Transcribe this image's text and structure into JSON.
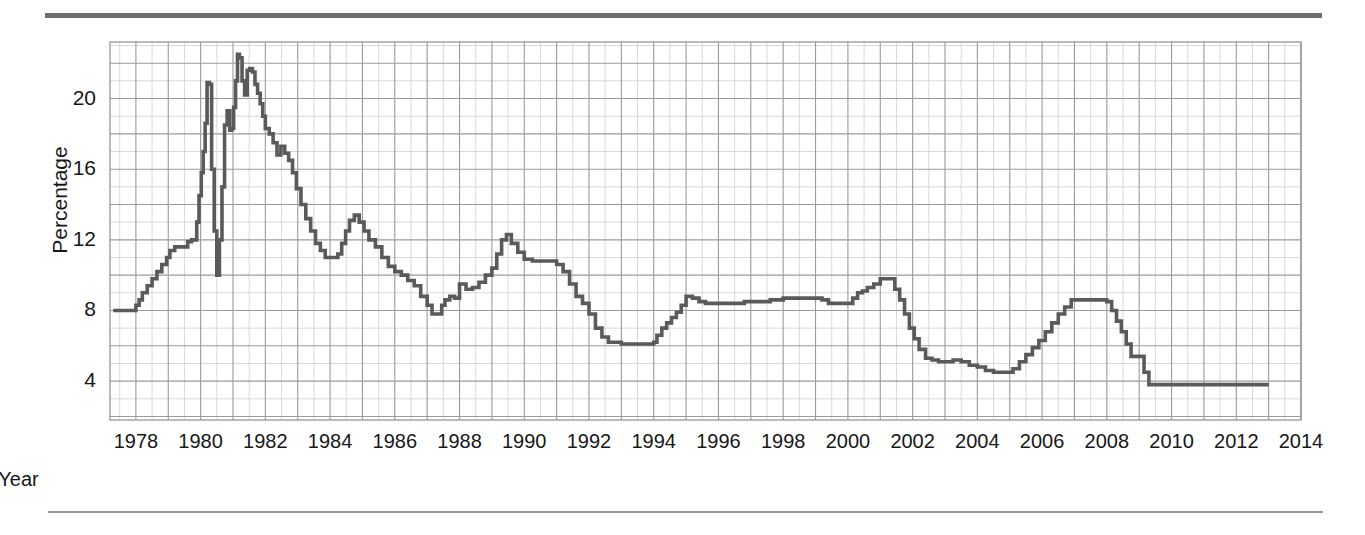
{
  "figure": {
    "has_top_rule": true,
    "has_bottom_rule": true,
    "background": "#ffffff",
    "line_color": "#5a5a5c",
    "grid_major_color": "#9b9b9e",
    "grid_minor_color": "#cfcfd2"
  },
  "chart_data": {
    "type": "line",
    "title": "",
    "subtitle": "",
    "xlabel": "Year",
    "ylabel": "Percentage",
    "xlim": [
      1977.2,
      2014.0
    ],
    "ylim": [
      1.8,
      23.2
    ],
    "xticks": [
      1978,
      1980,
      1982,
      1984,
      1986,
      1988,
      1990,
      1992,
      1994,
      1996,
      1998,
      2000,
      2002,
      2004,
      2006,
      2008,
      2010,
      2012,
      2014
    ],
    "xtick_labels": [
      "1978",
      "1980",
      "1982",
      "1984",
      "1986",
      "1988",
      "1990",
      "1992",
      "1994",
      "1996",
      "1998",
      "2000",
      "2002",
      "2004",
      "2006",
      "2008",
      "2010",
      "2012",
      "2014"
    ],
    "yticks": [
      4,
      8,
      12,
      16,
      20
    ],
    "ytick_labels": [
      "4",
      "8",
      "12",
      "16",
      "20"
    ],
    "grid": true,
    "grid_minor": true,
    "legend": false,
    "legend_position": "none",
    "series": [
      {
        "name": "Percentage",
        "color": "#5a5a5c",
        "x": [
          1977.3,
          1977.6,
          1977.9,
          1978.0,
          1978.1,
          1978.2,
          1978.35,
          1978.5,
          1978.65,
          1978.8,
          1978.95,
          1979.05,
          1979.2,
          1979.35,
          1979.5,
          1979.6,
          1979.72,
          1979.8,
          1979.88,
          1979.95,
          1980.02,
          1980.08,
          1980.14,
          1980.2,
          1980.27,
          1980.34,
          1980.42,
          1980.5,
          1980.58,
          1980.66,
          1980.74,
          1980.82,
          1980.9,
          1980.96,
          1981.02,
          1981.08,
          1981.14,
          1981.2,
          1981.28,
          1981.36,
          1981.44,
          1981.52,
          1981.6,
          1981.68,
          1981.76,
          1981.84,
          1981.92,
          1982.0,
          1982.12,
          1982.24,
          1982.36,
          1982.48,
          1982.6,
          1982.72,
          1982.84,
          1982.96,
          1983.1,
          1983.25,
          1983.4,
          1983.55,
          1983.7,
          1983.85,
          1984.0,
          1984.12,
          1984.24,
          1984.36,
          1984.48,
          1984.6,
          1984.75,
          1984.9,
          1985.05,
          1985.2,
          1985.4,
          1985.6,
          1985.8,
          1986.0,
          1986.2,
          1986.4,
          1986.6,
          1986.8,
          1987.0,
          1987.15,
          1987.3,
          1987.45,
          1987.55,
          1987.7,
          1987.85,
          1988.0,
          1988.2,
          1988.4,
          1988.6,
          1988.8,
          1989.0,
          1989.15,
          1989.3,
          1989.45,
          1989.6,
          1989.8,
          1990.0,
          1990.25,
          1990.5,
          1990.75,
          1991.0,
          1991.2,
          1991.4,
          1991.6,
          1991.8,
          1992.0,
          1992.2,
          1992.4,
          1992.6,
          1992.8,
          1993.0,
          1993.4,
          1993.8,
          1994.0,
          1994.1,
          1994.25,
          1994.4,
          1994.55,
          1994.7,
          1994.85,
          1995.0,
          1995.2,
          1995.4,
          1995.6,
          1995.8,
          1996.0,
          1996.4,
          1996.8,
          1997.2,
          1997.6,
          1998.0,
          1998.4,
          1998.8,
          1999.0,
          1999.2,
          1999.4,
          1999.6,
          1999.8,
          2000.0,
          2000.15,
          2000.3,
          2000.45,
          2000.6,
          2000.8,
          2001.0,
          2001.15,
          2001.3,
          2001.45,
          2001.6,
          2001.75,
          2001.9,
          2002.05,
          2002.2,
          2002.4,
          2002.6,
          2002.8,
          2003.0,
          2003.25,
          2003.5,
          2003.75,
          2004.0,
          2004.25,
          2004.5,
          2004.7,
          2004.9,
          2005.1,
          2005.3,
          2005.5,
          2005.7,
          2005.9,
          2006.1,
          2006.3,
          2006.5,
          2006.7,
          2006.9,
          2007.1,
          2007.4,
          2007.7,
          2008.0,
          2008.15,
          2008.3,
          2008.45,
          2008.6,
          2008.75,
          2008.9,
          2009.0,
          2009.15,
          2009.3,
          2010.0,
          2011.0,
          2012.0,
          2013.0
        ],
        "y": [
          8.0,
          8.0,
          8.0,
          8.3,
          8.6,
          9.0,
          9.4,
          9.8,
          10.2,
          10.6,
          11.0,
          11.4,
          11.6,
          11.6,
          11.6,
          11.9,
          12.0,
          12.0,
          13.0,
          14.5,
          15.8,
          17.0,
          18.6,
          20.9,
          20.8,
          16.0,
          12.5,
          10.0,
          12.0,
          15.0,
          18.5,
          19.3,
          18.2,
          18.3,
          19.5,
          21.0,
          22.5,
          22.3,
          21.0,
          20.2,
          21.6,
          21.7,
          21.5,
          20.8,
          20.3,
          19.7,
          19.0,
          18.3,
          18.0,
          17.5,
          16.8,
          17.3,
          16.9,
          16.5,
          15.8,
          14.9,
          14.0,
          13.2,
          12.5,
          11.8,
          11.4,
          11.0,
          11.0,
          11.0,
          11.2,
          11.8,
          12.5,
          13.1,
          13.4,
          13.0,
          12.5,
          12.0,
          11.6,
          11.0,
          10.5,
          10.2,
          10.0,
          9.7,
          9.4,
          8.8,
          8.3,
          7.8,
          7.8,
          8.3,
          8.6,
          8.8,
          8.7,
          9.5,
          9.2,
          9.3,
          9.6,
          10.0,
          10.4,
          11.2,
          12.0,
          12.3,
          11.8,
          11.3,
          10.9,
          10.8,
          10.8,
          10.8,
          10.6,
          10.2,
          9.5,
          8.8,
          8.4,
          7.8,
          7.0,
          6.5,
          6.2,
          6.2,
          6.1,
          6.1,
          6.1,
          6.2,
          6.6,
          7.0,
          7.3,
          7.6,
          7.9,
          8.3,
          8.8,
          8.7,
          8.5,
          8.4,
          8.4,
          8.4,
          8.4,
          8.5,
          8.5,
          8.6,
          8.7,
          8.7,
          8.7,
          8.7,
          8.6,
          8.4,
          8.4,
          8.4,
          8.4,
          8.7,
          9.0,
          9.1,
          9.3,
          9.5,
          9.8,
          9.8,
          9.8,
          9.2,
          8.6,
          7.8,
          7.0,
          6.4,
          5.8,
          5.3,
          5.2,
          5.1,
          5.1,
          5.2,
          5.1,
          4.9,
          4.8,
          4.6,
          4.5,
          4.5,
          4.5,
          4.7,
          5.1,
          5.5,
          5.9,
          6.3,
          6.8,
          7.3,
          7.8,
          8.2,
          8.6,
          8.6,
          8.6,
          8.6,
          8.5,
          8.0,
          7.4,
          6.8,
          6.1,
          5.4,
          5.4,
          5.4,
          4.5,
          3.8,
          3.8,
          3.8,
          3.8,
          3.8
        ]
      }
    ]
  }
}
